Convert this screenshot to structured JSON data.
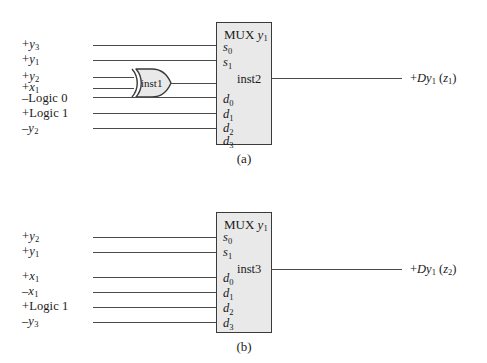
{
  "figure": {
    "type": "logic-circuit-diagram",
    "panels": [
      {
        "id": "a",
        "caption": "(a)",
        "inputs": [
          {
            "sign": "+",
            "name": "y",
            "subscript": "3",
            "text": "+y3",
            "target": "s0"
          },
          {
            "sign": "+",
            "name": "y",
            "subscript": "1",
            "text": "+y1",
            "target": "s1"
          },
          {
            "sign": "+",
            "name": "y",
            "subscript": "2",
            "text": "+y2",
            "target": "inst1"
          },
          {
            "sign": "+",
            "name": "x",
            "subscript": "1",
            "text": "+x1",
            "target": "inst1"
          },
          {
            "sign": "–",
            "name": "Logic 0",
            "subscript": "",
            "text": "–Logic 0",
            "target": "d1"
          },
          {
            "sign": "+",
            "name": "Logic 1",
            "subscript": "",
            "text": "+Logic 1",
            "target": "d2"
          },
          {
            "sign": "–",
            "name": "y",
            "subscript": "2",
            "text": "–y2",
            "target": "d3"
          }
        ],
        "gate": {
          "kind": "xor-gate",
          "label": "inst1"
        },
        "mux": {
          "title_text": "MUX",
          "title_var": "y",
          "title_sub": "1",
          "instance": "inst2",
          "select_ports": [
            "s0",
            "s1"
          ],
          "data_ports": [
            "d0",
            "d1",
            "d2",
            "d3"
          ]
        },
        "output": {
          "sign": "+",
          "var": "Dy",
          "sub": "1",
          "paren_var": "z",
          "paren_sub": "1",
          "text": "+Dy1 (z1)"
        }
      },
      {
        "id": "b",
        "caption": "(b)",
        "inputs": [
          {
            "sign": "+",
            "name": "y",
            "subscript": "2",
            "text": "+y2",
            "target": "s0"
          },
          {
            "sign": "+",
            "name": "y",
            "subscript": "1",
            "text": "+y1",
            "target": "s1"
          },
          {
            "sign": "+",
            "name": "x",
            "subscript": "1",
            "text": "+x1",
            "target": "d0"
          },
          {
            "sign": "–",
            "name": "x",
            "subscript": "1",
            "text": "–x1",
            "target": "d1"
          },
          {
            "sign": "+",
            "name": "Logic 1",
            "subscript": "",
            "text": "+Logic 1",
            "target": "d2"
          },
          {
            "sign": "–",
            "name": "y",
            "subscript": "3",
            "text": "–y3",
            "target": "d3"
          }
        ],
        "gate": null,
        "mux": {
          "title_text": "MUX",
          "title_var": "y",
          "title_sub": "1",
          "instance": "inst3",
          "select_ports": [
            "s0",
            "s1"
          ],
          "data_ports": [
            "d0",
            "d1",
            "d2",
            "d3"
          ]
        },
        "output": {
          "sign": "+",
          "var": "Dy",
          "sub": "1",
          "paren_var": "z",
          "paren_sub": "2",
          "text": "+Dy1 (z2)"
        }
      }
    ]
  },
  "colors": {
    "box_fill": "#e9e9e9",
    "box_border": "#3a3a3a",
    "wire": "#4a4a4a",
    "text": "#1a1a1a",
    "background": "#ffffff"
  }
}
